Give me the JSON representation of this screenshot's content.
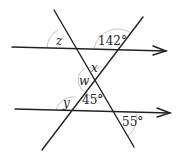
{
  "diagram": {
    "type": "parallel lines cut by two transversals",
    "labels": {
      "z": "z",
      "angle_top_right": "142°",
      "x": "x",
      "w": "w",
      "y": "y",
      "angle_middle": "45°",
      "angle_bottom_right": "55°"
    },
    "colors": {
      "line": "#222222",
      "arc": "#bdbdbd"
    }
  }
}
